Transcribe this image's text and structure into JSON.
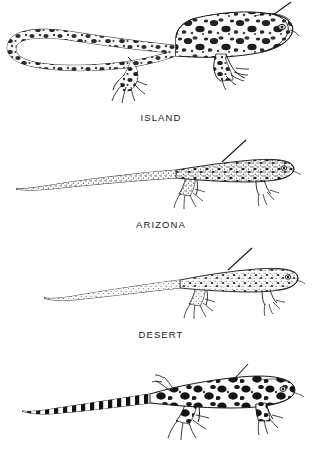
{
  "plate": {
    "title": "Lizard variation plate",
    "background_color": "#ffffff",
    "ink_color": "#1a1a1a",
    "width": 322,
    "height": 454,
    "figure_count": 4,
    "caption_count": 3
  },
  "figures": [
    {
      "id": "figure-island",
      "label": "ISLAND",
      "label_visible": true,
      "order": 1,
      "subject": "lizard",
      "view": "dorsolateral, head to the right",
      "tail": "long, curled back in a loop toward the left",
      "pattern": "bold dark irregular blotches and mottling over whole body and tail",
      "leader_line": "thin diagonal line from upper back toward upper right",
      "caption_y": 116
    },
    {
      "id": "figure-arizona",
      "label": "ARIZONA",
      "label_visible": true,
      "order": 2,
      "subject": "lizard",
      "view": "dorsolateral, head to the right",
      "tail": "very long, straight, tapering to the left",
      "pattern": "fine dense stippling with small dark speckles, lighter overall",
      "leader_line": "thin diagonal line from mid back toward upper right",
      "caption_y": 219
    },
    {
      "id": "figure-desert",
      "label": "DESERT",
      "label_visible": true,
      "order": 3,
      "subject": "lizard",
      "view": "dorsolateral, head to the right",
      "tail": "long, straight, tapering to the left",
      "pattern": "fine even stippling, pale, faint small spots",
      "leader_line": "thin diagonal line from mid back toward upper right",
      "caption_y": 329
    },
    {
      "id": "figure-unlabeled",
      "label": "",
      "label_visible": false,
      "order": 4,
      "subject": "lizard",
      "view": "dorsolateral, head to the right",
      "tail": "long, tapering to the left with strong dark and light banding",
      "pattern": "large bold black rounded blotches on pale body; banded tail",
      "leader_line": "thin diagonal line from upper back toward upper right",
      "caption_y": null
    }
  ]
}
